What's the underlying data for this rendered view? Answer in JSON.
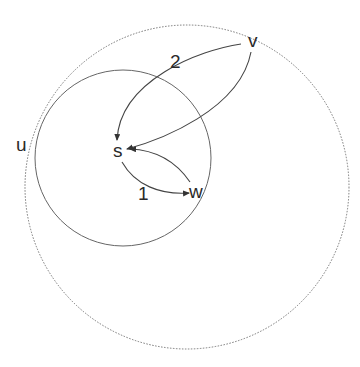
{
  "diagram": {
    "type": "graph",
    "colors": {
      "background": "#ffffff",
      "stroke": "#555555",
      "dotted_stroke": "#777777",
      "text": "#2a2a2a"
    },
    "regions": [
      {
        "id": "outer",
        "style": "dotted",
        "cx": 187,
        "cy": 187,
        "r": 162
      },
      {
        "id": "u",
        "style": "solid",
        "cx": 123,
        "cy": 158,
        "r": 88
      }
    ],
    "nodes": {
      "u": {
        "label": "u"
      },
      "v": {
        "label": "v"
      },
      "s": {
        "label": "s"
      },
      "w": {
        "label": "w"
      }
    },
    "edges": [
      {
        "from": "v",
        "to": "s",
        "label": "2"
      },
      {
        "from": "v",
        "to": "s",
        "label": ""
      },
      {
        "from": "s",
        "to": "w",
        "label": "1"
      },
      {
        "from": "w",
        "to": "s",
        "label": ""
      }
    ]
  }
}
